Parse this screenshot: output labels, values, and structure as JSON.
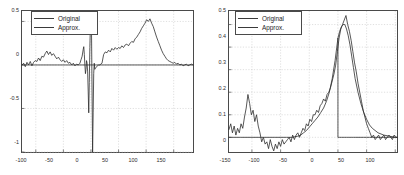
{
  "figure": {
    "background": "#ffffff",
    "axis_color": "#4a4a4a",
    "grid_color": "#c8c8c8",
    "line_color": "#2b2b2b"
  },
  "chart_data": [
    {
      "type": "line",
      "id": "left-panel",
      "title": "",
      "xlabel": "",
      "ylabel": "",
      "xlim": [
        -125,
        185
      ],
      "ylim": [
        -1.0,
        0.62
      ],
      "grid": true,
      "legend_position": "top-left",
      "xticks": [
        -100,
        -50,
        0,
        50,
        100,
        150
      ],
      "xticklabels": [
        "-100",
        "-50",
        "0",
        "50",
        "100",
        "150"
      ],
      "yticks": [
        0.5,
        0,
        -0.5,
        -1
      ],
      "yticklabels": [
        "0.5",
        "0",
        "-0.5",
        "-1"
      ],
      "series": [
        {
          "name": "Original",
          "x": [
            -125,
            -122,
            -119,
            -116,
            -113,
            -110,
            -107,
            -104,
            -101,
            -98,
            -95,
            -92,
            -89,
            -86,
            -83,
            -80,
            -77,
            -74,
            -71,
            -68,
            -65,
            -62,
            -59,
            -56,
            -53,
            -50,
            -47,
            -44,
            -41,
            -38,
            -35,
            -32,
            -29,
            -26,
            -23,
            -20,
            -18,
            -16,
            -14,
            -13,
            -12,
            -11,
            -10,
            -9,
            -8,
            -7,
            -6,
            -5,
            -4,
            -3,
            -2,
            -1,
            0,
            1,
            2,
            3,
            4,
            5,
            6,
            7,
            8,
            9,
            10,
            12,
            14,
            16,
            18,
            20,
            23,
            26,
            29,
            32,
            35,
            38,
            41,
            44,
            47,
            50,
            53,
            56,
            59,
            62,
            65,
            68,
            71,
            74,
            77,
            80,
            83,
            86,
            89,
            92,
            95,
            98,
            101,
            104,
            107,
            110,
            113,
            116,
            119,
            122,
            125,
            128,
            131,
            134,
            137,
            140,
            143,
            146,
            149,
            152,
            155,
            158,
            161,
            164,
            167,
            170,
            173,
            176,
            179,
            182,
            185
          ],
          "y": [
            0.0,
            0.02,
            -0.02,
            0.03,
            0.0,
            0.04,
            -0.01,
            0.03,
            0.05,
            0.04,
            0.08,
            0.05,
            0.1,
            0.09,
            0.13,
            0.16,
            0.12,
            0.15,
            0.11,
            0.13,
            0.1,
            0.07,
            0.09,
            0.06,
            0.04,
            0.06,
            0.03,
            0.05,
            0.02,
            0.03,
            0.0,
            0.02,
            -0.01,
            0.01,
            0.0,
            0.02,
            0.06,
            0.1,
            0.18,
            0.21,
            0.12,
            0.0,
            -0.1,
            -0.05,
            0.05,
            0.02,
            -0.08,
            -0.3,
            -0.55,
            -0.2,
            0.2,
            0.45,
            0.5,
            0.4,
            -0.3,
            -1.0,
            -0.55,
            -0.1,
            0.02,
            -0.05,
            -0.04,
            -0.03,
            -0.02,
            -0.01,
            0.0,
            0.0,
            0.01,
            0.02,
            0.12,
            0.15,
            0.14,
            0.17,
            0.15,
            0.19,
            0.17,
            0.2,
            0.18,
            0.2,
            0.19,
            0.22,
            0.2,
            0.23,
            0.24,
            0.22,
            0.25,
            0.27,
            0.26,
            0.3,
            0.32,
            0.35,
            0.38,
            0.42,
            0.45,
            0.48,
            0.52,
            0.5,
            0.53,
            0.48,
            0.44,
            0.38,
            0.32,
            0.27,
            0.22,
            0.17,
            0.13,
            0.1,
            0.07,
            0.05,
            0.04,
            0.03,
            0.02,
            0.03,
            0.01,
            0.02,
            0.0,
            0.01,
            -0.01,
            0.0,
            0.01,
            -0.01,
            0.0,
            0.01,
            0.0,
            0.0
          ]
        },
        {
          "name": "Approx.",
          "x": [
            -125,
            -60,
            -40,
            -20,
            -10,
            -5,
            -2,
            0,
            2,
            5,
            10,
            14,
            18,
            20,
            40,
            80,
            120,
            160,
            185
          ],
          "y": [
            0.0,
            0.0,
            0.0,
            0.0,
            0.0,
            0.0,
            0.0,
            0.0,
            0.0,
            0.0,
            0.0,
            0.0,
            0.0,
            0.0,
            0.0,
            0.0,
            0.0,
            0.0,
            0.0
          ]
        }
      ]
    },
    {
      "type": "line",
      "id": "right-panel",
      "title": "",
      "xlabel": "",
      "ylabel": "",
      "xlim": [
        -190,
        103
      ],
      "ylim": [
        -0.065,
        0.56
      ],
      "grid": true,
      "legend_position": "top-left",
      "xticks": [
        -150,
        -100,
        -50,
        0,
        50,
        100
      ],
      "xticklabels": [
        "-150",
        "-100",
        "-50",
        "0",
        "50",
        "100"
      ],
      "yticks": [
        0.5,
        0.4,
        0.3,
        0.2,
        0.1,
        0
      ],
      "yticklabels": [
        "0.5",
        "0.4",
        "0.3",
        "0.2",
        "0.1",
        "0"
      ],
      "series": [
        {
          "name": "Original",
          "x": [
            -190,
            -187,
            -184,
            -181,
            -178,
            -175,
            -172,
            -169,
            -166,
            -163,
            -160,
            -157,
            -154,
            -151,
            -148,
            -145,
            -142,
            -139,
            -136,
            -133,
            -130,
            -127,
            -124,
            -121,
            -118,
            -115,
            -112,
            -109,
            -106,
            -103,
            -100,
            -97,
            -94,
            -91,
            -88,
            -85,
            -82,
            -79,
            -76,
            -73,
            -70,
            -67,
            -64,
            -61,
            -58,
            -55,
            -52,
            -49,
            -46,
            -43,
            -40,
            -37,
            -34,
            -31,
            -28,
            -25,
            -22,
            -19,
            -16,
            -13,
            -10,
            -7,
            -4,
            -1,
            2,
            5,
            8,
            11,
            14,
            17,
            20,
            23,
            26,
            29,
            32,
            35,
            38,
            41,
            44,
            47,
            50,
            53,
            56,
            59,
            62,
            65,
            68,
            71,
            74,
            77,
            80,
            83,
            86,
            89,
            92,
            95,
            98,
            101,
            103
          ],
          "y": [
            0.035,
            0.06,
            0.02,
            0.05,
            0.01,
            0.04,
            0.02,
            0.06,
            0.04,
            0.09,
            0.13,
            0.19,
            0.15,
            0.1,
            0.12,
            0.07,
            0.1,
            0.05,
            0.02,
            -0.02,
            0.0,
            -0.03,
            -0.02,
            -0.05,
            -0.01,
            -0.04,
            -0.06,
            -0.03,
            -0.05,
            -0.02,
            -0.04,
            -0.01,
            -0.03,
            -0.02,
            -0.01,
            0.0,
            -0.02,
            0.01,
            -0.01,
            0.01,
            0.02,
            0.0,
            0.02,
            0.04,
            0.03,
            0.06,
            0.05,
            0.08,
            0.07,
            0.1,
            0.1,
            0.12,
            0.11,
            0.14,
            0.15,
            0.17,
            0.16,
            0.19,
            0.2,
            0.22,
            0.25,
            0.28,
            0.32,
            0.38,
            0.44,
            0.48,
            0.5,
            0.52,
            0.54,
            0.5,
            0.47,
            0.43,
            0.38,
            0.33,
            0.29,
            0.24,
            0.2,
            0.16,
            0.12,
            0.09,
            0.06,
            0.04,
            0.02,
            0.0,
            0.01,
            -0.01,
            0.0,
            0.01,
            -0.01,
            0.0,
            0.01,
            -0.01,
            0.0,
            0.01,
            0.0,
            -0.01,
            0.01,
            0.0,
            0.0
          ]
        },
        {
          "name": "Approx.",
          "x": [
            -190,
            -170,
            -150,
            -130,
            -110,
            -90,
            -80,
            -70,
            -65,
            -60,
            -55,
            -50,
            -45,
            -40,
            -35,
            -30,
            -25,
            -20,
            -15,
            -10,
            -5,
            -2,
            0,
            0,
            3,
            6,
            9,
            12,
            15,
            18,
            21,
            24,
            27,
            30,
            35,
            40,
            45,
            50,
            55,
            60,
            70,
            80,
            90,
            100,
            103
          ],
          "y": [
            0.0,
            0.0,
            0.0,
            0.0,
            0.0,
            0.0,
            0.0,
            0.005,
            0.01,
            0.02,
            0.03,
            0.045,
            0.06,
            0.075,
            0.09,
            0.11,
            0.13,
            0.16,
            0.2,
            0.26,
            0.34,
            0.4,
            0.44,
            0.0,
            0.0,
            0.0,
            0.0,
            0.0,
            0.0,
            0.0,
            0.0,
            0.0,
            0.0,
            0.0,
            0.0,
            0.0,
            0.0,
            0.0,
            0.0,
            0.0,
            0.0,
            0.0,
            0.0,
            0.0,
            0.0
          ]
        }
      ],
      "approx_segment_2": {
        "x": [
          0,
          3,
          6,
          9,
          12,
          15,
          18,
          21,
          24,
          27,
          30,
          35,
          40,
          45,
          50,
          55,
          60,
          70,
          80,
          90,
          100,
          103
        ],
        "y": [
          0.44,
          0.47,
          0.49,
          0.5,
          0.5,
          0.48,
          0.45,
          0.41,
          0.36,
          0.31,
          0.26,
          0.2,
          0.15,
          0.11,
          0.08,
          0.055,
          0.04,
          0.02,
          0.01,
          0.005,
          0.0,
          0.0
        ]
      }
    }
  ],
  "panels": [
    {
      "id": "left",
      "legend": {
        "entries": [
          {
            "label": "Original"
          },
          {
            "label": "Approx."
          }
        ]
      }
    },
    {
      "id": "right",
      "legend": {
        "entries": [
          {
            "label": "Original"
          },
          {
            "label": "Approx."
          }
        ]
      }
    }
  ]
}
